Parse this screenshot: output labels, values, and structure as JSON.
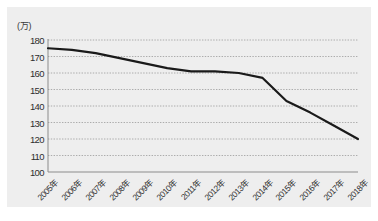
{
  "chart_data": {
    "type": "line",
    "title": "",
    "subtitle": "",
    "xlabel": "",
    "ylabel": "",
    "unit_label": "(万)",
    "categories": [
      "2005年",
      "2006年",
      "2007年",
      "2008年",
      "2009年",
      "2010年",
      "2011年",
      "2012年",
      "2013年",
      "2014年",
      "2015年",
      "2016年",
      "2017年",
      "2018年"
    ],
    "series": [
      {
        "name": "",
        "values": [
          175,
          174,
          172,
          169,
          166,
          163,
          161,
          161,
          160,
          157,
          143,
          136,
          128,
          120
        ]
      }
    ],
    "ylim": [
      100,
      180
    ],
    "ytick_labels": [
      "180",
      "170",
      "160",
      "150",
      "140",
      "130",
      "120",
      "110",
      "100"
    ],
    "ytick_values": [
      180,
      170,
      160,
      150,
      140,
      130,
      120,
      110,
      100
    ],
    "ystep": 10,
    "grid": true,
    "grid_axis": "y",
    "grid_style": "dotted",
    "legend": false,
    "legend_position": "none",
    "colors": {
      "line": "#1a1a1a",
      "grid": "#9a9a9a",
      "axis": "#8c8c8c",
      "panel_background": "#eeeeee",
      "figure_background": "#ffffff",
      "text": "#2f2f2f"
    },
    "line_width": 2.2,
    "markers": false,
    "xtick_rotation": -45
  }
}
